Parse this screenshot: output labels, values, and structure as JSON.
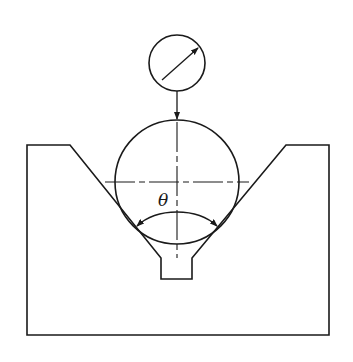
{
  "diagram": {
    "angle_label": "θ",
    "components": [
      {
        "name": "dial-indicator",
        "shape": "circle",
        "center": [
          177,
          63
        ],
        "radius": 28
      },
      {
        "name": "sphere",
        "shape": "circle",
        "center": [
          177,
          182
        ],
        "radius": 62
      },
      {
        "name": "v-block",
        "shape": "polygon"
      },
      {
        "name": "angle-arc",
        "label": "θ"
      }
    ],
    "colors": {
      "line": "#1a1a1a",
      "background": "#ffffff"
    }
  }
}
